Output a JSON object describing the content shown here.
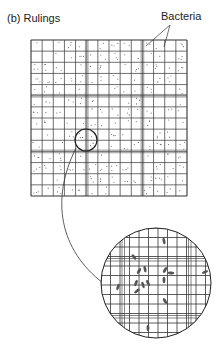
{
  "figure": {
    "panel_label": "(b)  Rulings",
    "annotation": "Bacteria"
  },
  "grid": {
    "x": 31,
    "y": 40,
    "size": 156,
    "cells": 14,
    "triple_lines_at": [
      5,
      10
    ],
    "line_color": "#333333"
  },
  "highlight_circle": {
    "cx": 86,
    "cy": 140,
    "r": 11
  },
  "magnified_circle": {
    "cx": 156,
    "cy": 283,
    "r": 55
  },
  "colors": {
    "ink": "#2a2a2a",
    "bacteria": "#555555",
    "background": "#ffffff"
  }
}
